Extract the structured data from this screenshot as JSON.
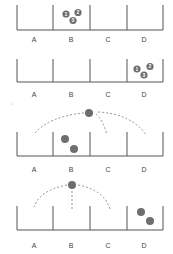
{
  "colors": {
    "line": "#555555",
    "ball": "#6e6e6e",
    "ball_text": "#ffffff",
    "arc": "#777777"
  },
  "bin_labels": [
    "A",
    "B",
    "C",
    "D"
  ],
  "panels": [
    {
      "name": "panel-1",
      "description": "Three numbered balls in bin B",
      "balls": [
        {
          "label": "1",
          "bin": "B"
        },
        {
          "label": "2",
          "bin": "B"
        },
        {
          "label": "3",
          "bin": "B"
        }
      ]
    },
    {
      "name": "panel-2",
      "description": "Three numbered balls in bin D",
      "balls": [
        {
          "label": "1",
          "bin": "D"
        },
        {
          "label": "2",
          "bin": "D"
        },
        {
          "label": "3",
          "bin": "D"
        }
      ]
    },
    {
      "name": "panel-3",
      "description": "Two balls in bin B, one ball above with dashed trajectories to A, C, D",
      "balls_in_bins": [
        {
          "bin": "B"
        },
        {
          "bin": "B"
        }
      ],
      "moving_ball_targets": [
        "A",
        "C",
        "D"
      ]
    },
    {
      "name": "panel-4",
      "description": "Two balls in bin D, one ball above with dashed trajectories to A, B, C",
      "balls_in_bins": [
        {
          "bin": "D"
        },
        {
          "bin": "D"
        }
      ],
      "moving_ball_targets": [
        "A",
        "B",
        "C"
      ]
    }
  ]
}
